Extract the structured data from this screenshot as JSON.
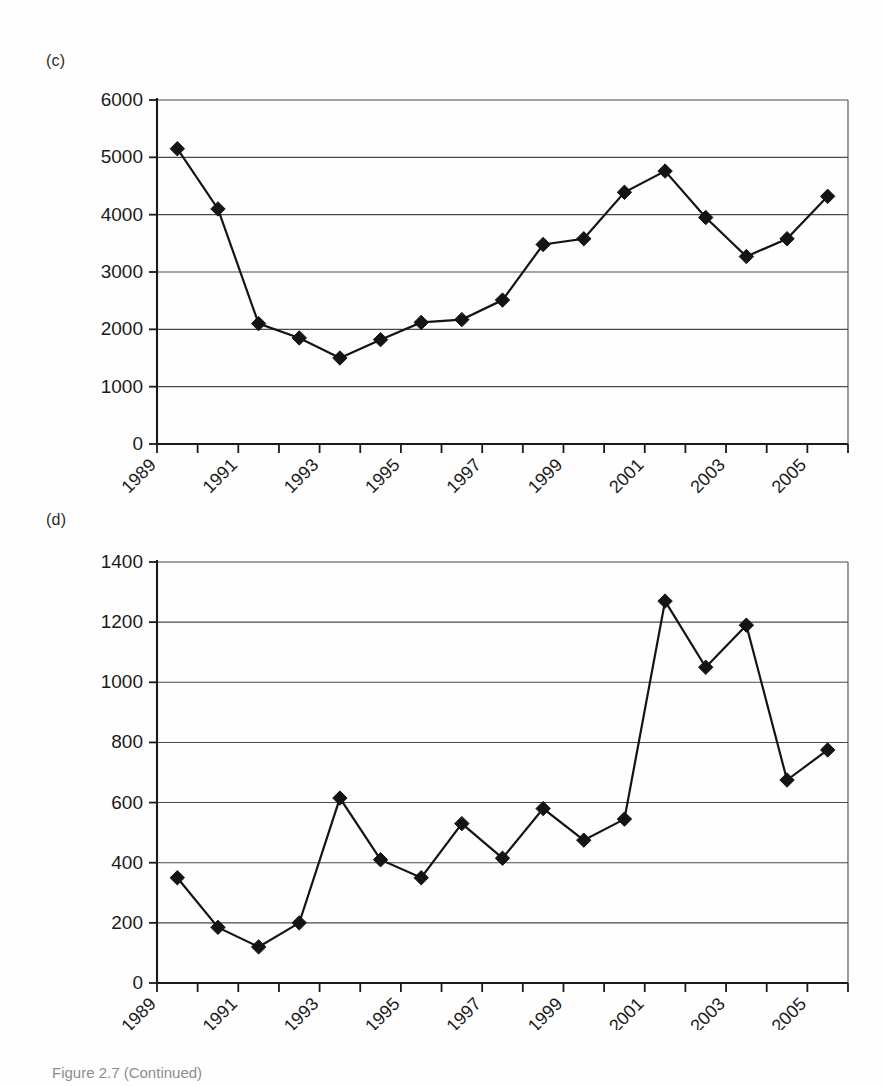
{
  "figure": {
    "caption": "Figure 2.7 (Continued)"
  },
  "panels": [
    {
      "label": "(c)",
      "chart_ref": 0
    },
    {
      "label": "(d)",
      "chart_ref": 1
    }
  ],
  "chart_data": [
    {
      "type": "line",
      "title": "",
      "subtitle": "",
      "panel_label": "(c)",
      "xlabel": "",
      "ylabel": "",
      "grid": true,
      "legend": "none",
      "marker": "diamond",
      "line_color": "#141414",
      "marker_color": "#141414",
      "ylim": [
        0,
        6000
      ],
      "ytick_labels": [
        "0",
        "1000",
        "2000",
        "3000",
        "4000",
        "5000",
        "6000"
      ],
      "yticks": [
        0,
        1000,
        2000,
        3000,
        4000,
        5000,
        6000
      ],
      "xtick_labels": [
        "1989",
        "1991",
        "1993",
        "1995",
        "1997",
        "1999",
        "2001",
        "2003",
        "2005"
      ],
      "xticks": [
        1989,
        1991,
        1993,
        1995,
        1997,
        1999,
        2001,
        2003,
        2005
      ],
      "x_axis_start": 1989,
      "x_axis_end": 2006,
      "x": [
        1990,
        1991,
        1992,
        1993,
        1994,
        1995,
        1996,
        1997,
        1998,
        1999,
        2000,
        2001,
        2002,
        2003,
        2004,
        2005,
        2006
      ],
      "values": [
        5150,
        4100,
        2100,
        1850,
        1500,
        1820,
        2120,
        2170,
        2510,
        3480,
        3580,
        4390,
        4760,
        3950,
        3270,
        3580,
        4320
      ]
    },
    {
      "type": "line",
      "title": "",
      "subtitle": "",
      "panel_label": "(d)",
      "xlabel": "",
      "ylabel": "",
      "grid": true,
      "legend": "none",
      "marker": "diamond",
      "line_color": "#141414",
      "marker_color": "#141414",
      "ylim": [
        0,
        1400
      ],
      "ytick_labels": [
        "0",
        "200",
        "400",
        "600",
        "800",
        "1000",
        "1200",
        "1400"
      ],
      "yticks": [
        0,
        200,
        400,
        600,
        800,
        1000,
        1200,
        1400
      ],
      "xtick_labels": [
        "1989",
        "1991",
        "1993",
        "1995",
        "1997",
        "1999",
        "2001",
        "2003",
        "2005"
      ],
      "xticks": [
        1989,
        1991,
        1993,
        1995,
        1997,
        1999,
        2001,
        2003,
        2005
      ],
      "x_axis_start": 1989,
      "x_axis_end": 2006,
      "x": [
        1990,
        1991,
        1992,
        1993,
        1994,
        1995,
        1996,
        1997,
        1998,
        1999,
        2000,
        2001,
        2002,
        2003,
        2004,
        2005,
        2006
      ],
      "values": [
        350,
        185,
        120,
        200,
        615,
        410,
        350,
        530,
        415,
        580,
        475,
        545,
        1270,
        1050,
        1190,
        675,
        775
      ]
    }
  ]
}
